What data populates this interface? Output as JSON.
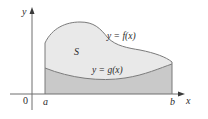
{
  "diagram": {
    "type": "area-between-curves",
    "axes": {
      "x_label": "x",
      "y_label": "y",
      "origin_label": "0"
    },
    "bounds": {
      "left_label": "a",
      "right_label": "b"
    },
    "region": {
      "label": "S"
    },
    "curves": [
      {
        "name": "upper",
        "label": "y = f(x)"
      },
      {
        "name": "lower",
        "label": "y = g(x)"
      }
    ],
    "colors": {
      "axis": "#6e6e6e",
      "curve": "#7a7a7a",
      "region_fill": "#e9e9e9",
      "under_g_fill": "#c9c9c9",
      "text": "#2b2b2b"
    }
  }
}
